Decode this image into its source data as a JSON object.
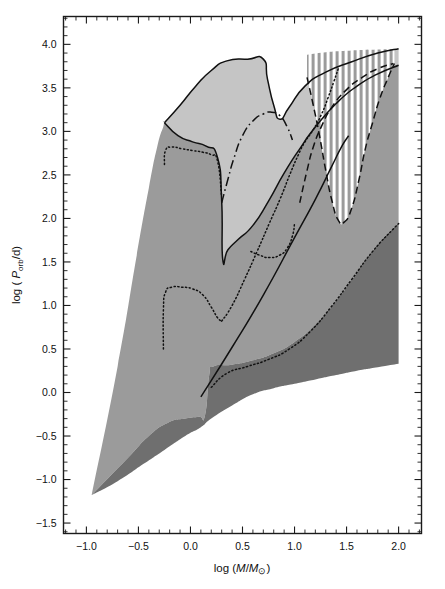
{
  "figure": {
    "background": "#ffffff",
    "frame_color": "#1a1a1a"
  },
  "axes": {
    "x_label": "log (M/M⊙)",
    "y_label": "log ( P",
    "y_label_sub": "orb",
    "y_label_tail": "/d)",
    "x_ticks": [
      "-1.0",
      "-0.5",
      "0.0",
      "0.5",
      "1.0",
      "1.5",
      "2.0"
    ],
    "y_ticks": [
      "4.0",
      "3.5",
      "3.0",
      "2.5",
      "2.0",
      "1.5",
      "1.0",
      "0.5",
      "0.0",
      "-0.5",
      "-1.0",
      "-1.5"
    ]
  },
  "colors": {
    "light_gray": "#c5c5c5",
    "mid_gray": "#9b9b9b",
    "dark_gray": "#6f6f6f",
    "hatch_white": "#ffffff",
    "line_black": "#111111"
  },
  "chart_data": {
    "type": "area",
    "title": "",
    "xlabel": "log (M/M⊙)",
    "ylabel": "log ( P_orb/d)",
    "xlim": [
      -1.22,
      2.22
    ],
    "ylim": [
      -1.62,
      4.32
    ],
    "grid": false,
    "legend": "none",
    "x_ticks": [
      -1.0,
      -0.5,
      0.0,
      0.5,
      1.0,
      1.5,
      2.0
    ],
    "y_ticks": [
      4.0,
      3.5,
      3.0,
      2.5,
      2.0,
      1.5,
      1.0,
      0.5,
      0.0,
      -0.5,
      -1.0,
      -1.5
    ],
    "x_minor_tick_step": 0.1,
    "y_minor_tick_step": 0.1,
    "regions": [
      {
        "name": "light-gray-region",
        "fill": "#c5c5c5",
        "description": "Upper light grey envelope spanning log M from about -0.25 to 2.0, top boundary rising from 3.1 to a plateau near 3.83 between 0.35 and 0.72, notching to 3.15 at 0.85, then rising again to 3.95 at 2.0",
        "upper_boundary": [
          [
            -0.25,
            3.1
          ],
          [
            -0.1,
            3.3
          ],
          [
            0.05,
            3.52
          ],
          [
            0.2,
            3.7
          ],
          [
            0.35,
            3.81
          ],
          [
            0.55,
            3.83
          ],
          [
            0.7,
            3.83
          ],
          [
            0.74,
            3.6
          ],
          [
            0.8,
            3.3
          ],
          [
            0.86,
            3.14
          ],
          [
            0.95,
            3.28
          ],
          [
            1.1,
            3.52
          ],
          [
            1.3,
            3.68
          ],
          [
            1.55,
            3.8
          ],
          [
            1.8,
            3.9
          ],
          [
            2.0,
            3.95
          ]
        ],
        "lower_boundary": [
          [
            -0.25,
            3.1
          ],
          [
            -0.12,
            2.95
          ],
          [
            0.02,
            2.88
          ],
          [
            0.15,
            2.83
          ],
          [
            0.26,
            2.7
          ],
          [
            0.3,
            2.2
          ],
          [
            0.31,
            1.53
          ],
          [
            0.36,
            1.64
          ],
          [
            0.46,
            1.76
          ],
          [
            0.6,
            1.92
          ],
          [
            0.75,
            2.2
          ],
          [
            0.9,
            2.52
          ],
          [
            1.05,
            2.8
          ],
          [
            1.2,
            3.05
          ],
          [
            1.4,
            3.32
          ],
          [
            1.6,
            3.52
          ],
          [
            1.8,
            3.66
          ],
          [
            2.0,
            3.76
          ]
        ]
      },
      {
        "name": "mid-gray-region",
        "fill": "#9b9b9b",
        "description": "Main medium grey wedge from the convergence point near (-0.95,-1.18) widening rightward; upper boundary peaks at 3.1 near -0.25 then drops to 1.53 at 0.30 and rises to 3.76 at 2.0",
        "upper_boundary": [
          [
            -0.95,
            -1.18
          ],
          [
            -0.7,
            0.3
          ],
          [
            -0.52,
            1.55
          ],
          [
            -0.4,
            2.35
          ],
          [
            -0.32,
            2.82
          ],
          [
            -0.26,
            3.06
          ],
          [
            -0.25,
            3.1
          ],
          [
            -0.12,
            2.95
          ],
          [
            0.02,
            2.88
          ],
          [
            0.15,
            2.83
          ],
          [
            0.26,
            2.7
          ],
          [
            0.3,
            2.2
          ],
          [
            0.31,
            1.53
          ],
          [
            0.36,
            1.64
          ],
          [
            0.46,
            1.76
          ],
          [
            0.6,
            1.92
          ],
          [
            0.75,
            2.2
          ],
          [
            0.9,
            2.52
          ],
          [
            1.05,
            2.8
          ],
          [
            1.2,
            3.05
          ],
          [
            1.4,
            3.32
          ],
          [
            1.6,
            3.52
          ],
          [
            1.8,
            3.66
          ],
          [
            2.0,
            3.76
          ]
        ],
        "lower_boundary": [
          [
            -0.95,
            -1.18
          ],
          [
            -0.6,
            -0.75
          ],
          [
            -0.4,
            -0.5
          ],
          [
            -0.22,
            -0.35
          ],
          [
            -0.05,
            -0.3
          ],
          [
            0.08,
            -0.28
          ],
          [
            0.14,
            -0.26
          ],
          [
            0.18,
            0.2
          ],
          [
            0.22,
            0.3
          ],
          [
            0.4,
            0.32
          ],
          [
            0.6,
            0.37
          ],
          [
            0.8,
            0.45
          ],
          [
            1.0,
            0.58
          ],
          [
            1.2,
            0.78
          ],
          [
            1.4,
            1.05
          ],
          [
            1.6,
            1.38
          ],
          [
            1.8,
            1.7
          ],
          [
            2.0,
            1.95
          ]
        ]
      },
      {
        "name": "dark-gray-band",
        "fill": "#6f6f6f",
        "description": "Narrow dark grey band along the lower edge of the medium grey wedge, widening to the right from the apex at (-0.95,-1.18) to span 0.33 to 1.95 at log M = 2.0",
        "upper_boundary": [
          [
            -0.95,
            -1.18
          ],
          [
            -0.6,
            -0.75
          ],
          [
            -0.4,
            -0.5
          ],
          [
            -0.22,
            -0.35
          ],
          [
            -0.05,
            -0.3
          ],
          [
            0.08,
            -0.28
          ],
          [
            0.14,
            -0.26
          ],
          [
            0.18,
            0.2
          ],
          [
            0.22,
            0.3
          ],
          [
            0.4,
            0.32
          ],
          [
            0.6,
            0.37
          ],
          [
            0.8,
            0.45
          ],
          [
            1.0,
            0.58
          ],
          [
            1.2,
            0.78
          ],
          [
            1.4,
            1.05
          ],
          [
            1.6,
            1.38
          ],
          [
            1.8,
            1.7
          ],
          [
            2.0,
            1.95
          ]
        ],
        "lower_boundary": [
          [
            -0.95,
            -1.18
          ],
          [
            -0.7,
            -1.02
          ],
          [
            -0.45,
            -0.82
          ],
          [
            -0.25,
            -0.66
          ],
          [
            -0.05,
            -0.5
          ],
          [
            0.1,
            -0.4
          ],
          [
            0.2,
            -0.3
          ],
          [
            0.4,
            -0.15
          ],
          [
            0.6,
            -0.02
          ],
          [
            0.8,
            0.05
          ],
          [
            1.0,
            0.1
          ],
          [
            1.2,
            0.15
          ],
          [
            1.4,
            0.2
          ],
          [
            1.6,
            0.25
          ],
          [
            1.8,
            0.29
          ],
          [
            2.0,
            0.33
          ]
        ]
      },
      {
        "name": "hatched-region",
        "fill": "vertical white stripes on grey",
        "description": "Vertically hatched lens-shaped region in the upper right, bounded left by the long-dash curve rising from about (1.05,2.18) and right by the dashed curve dipping to 1.95 near 1.43, topped by the light grey envelope upper edge near 3.7 to 3.95",
        "x_range": [
          1.12,
          1.95
        ],
        "y_range": [
          1.93,
          3.95
        ],
        "stripe_spacing_px": 6
      }
    ],
    "curves": [
      {
        "name": "solid-upper-envelope",
        "style": "solid",
        "points": [
          [
            -0.25,
            3.1
          ],
          [
            -0.1,
            3.3
          ],
          [
            0.05,
            3.52
          ],
          [
            0.2,
            3.7
          ],
          [
            0.35,
            3.81
          ],
          [
            0.55,
            3.83
          ],
          [
            0.7,
            3.83
          ],
          [
            0.74,
            3.6
          ],
          [
            0.8,
            3.3
          ],
          [
            0.86,
            3.14
          ],
          [
            0.95,
            3.28
          ],
          [
            1.1,
            3.52
          ],
          [
            1.3,
            3.68
          ],
          [
            1.55,
            3.8
          ],
          [
            1.8,
            3.9
          ],
          [
            2.0,
            3.95
          ]
        ]
      },
      {
        "name": "solid-inner-boundary",
        "style": "solid",
        "points": [
          [
            -0.25,
            3.1
          ],
          [
            -0.12,
            2.95
          ],
          [
            0.02,
            2.88
          ],
          [
            0.15,
            2.83
          ],
          [
            0.26,
            2.7
          ],
          [
            0.3,
            2.2
          ],
          [
            0.31,
            1.53
          ],
          [
            0.36,
            1.64
          ],
          [
            0.46,
            1.76
          ],
          [
            0.6,
            1.92
          ],
          [
            0.75,
            2.2
          ],
          [
            0.9,
            2.52
          ],
          [
            1.05,
            2.8
          ],
          [
            1.2,
            3.05
          ],
          [
            1.4,
            3.32
          ],
          [
            1.6,
            3.52
          ],
          [
            1.8,
            3.66
          ],
          [
            2.0,
            3.76
          ]
        ]
      },
      {
        "name": "dash-dot-curve",
        "style": "dash-dot",
        "points": [
          [
            0.3,
            2.18
          ],
          [
            0.36,
            2.45
          ],
          [
            0.42,
            2.7
          ],
          [
            0.5,
            2.95
          ],
          [
            0.6,
            3.12
          ],
          [
            0.7,
            3.2
          ],
          [
            0.78,
            3.22
          ],
          [
            0.86,
            3.18
          ],
          [
            0.93,
            3.05
          ],
          [
            0.98,
            2.9
          ]
        ]
      },
      {
        "name": "dotted-upper-left",
        "style": "dotted",
        "points": [
          [
            -0.25,
            2.62
          ],
          [
            -0.24,
            2.78
          ],
          [
            -0.18,
            2.82
          ],
          [
            -0.08,
            2.8
          ],
          [
            0.02,
            2.78
          ],
          [
            0.12,
            2.76
          ],
          [
            0.2,
            2.73
          ],
          [
            0.26,
            2.66
          ],
          [
            0.3,
            2.25
          ]
        ]
      },
      {
        "name": "dotted-lower-left",
        "style": "dotted",
        "points": [
          [
            -0.26,
            0.5
          ],
          [
            -0.26,
            0.95
          ],
          [
            -0.24,
            1.15
          ],
          [
            -0.18,
            1.21
          ],
          [
            -0.08,
            1.21
          ],
          [
            0.02,
            1.19
          ],
          [
            0.12,
            1.12
          ],
          [
            0.2,
            0.98
          ],
          [
            0.26,
            0.86
          ],
          [
            0.3,
            0.82
          ]
        ]
      },
      {
        "name": "dotted-mid-right",
        "style": "dotted",
        "points": [
          [
            0.3,
            0.82
          ],
          [
            0.4,
            1.0
          ],
          [
            0.52,
            1.3
          ],
          [
            0.64,
            1.62
          ],
          [
            0.76,
            1.95
          ],
          [
            0.86,
            2.22
          ],
          [
            0.96,
            2.52
          ],
          [
            1.04,
            2.74
          ],
          [
            1.1,
            2.88
          ],
          [
            1.18,
            3.02
          ],
          [
            1.26,
            3.2
          ],
          [
            1.32,
            3.38
          ],
          [
            1.38,
            3.58
          ],
          [
            1.42,
            3.72
          ]
        ]
      },
      {
        "name": "dotted-lower-hook",
        "style": "dotted",
        "points": [
          [
            0.58,
            1.62
          ],
          [
            0.66,
            1.58
          ],
          [
            0.76,
            1.55
          ],
          [
            0.86,
            1.58
          ],
          [
            0.93,
            1.66
          ],
          [
            0.98,
            1.8
          ],
          [
            1.0,
            1.94
          ]
        ]
      },
      {
        "name": "dotted-bottom-right",
        "style": "dotted",
        "points": [
          [
            0.2,
            0.06
          ],
          [
            0.35,
            0.22
          ],
          [
            0.55,
            0.3
          ],
          [
            0.75,
            0.38
          ],
          [
            0.95,
            0.5
          ],
          [
            1.15,
            0.7
          ],
          [
            1.35,
            0.98
          ],
          [
            1.55,
            1.3
          ],
          [
            1.75,
            1.62
          ],
          [
            1.95,
            1.88
          ],
          [
            2.0,
            1.94
          ]
        ]
      },
      {
        "name": "solid-diagonal-line",
        "style": "solid",
        "points": [
          [
            0.1,
            -0.05
          ],
          [
            0.4,
            0.52
          ],
          [
            0.7,
            1.12
          ],
          [
            1.0,
            1.78
          ],
          [
            1.2,
            2.22
          ],
          [
            1.35,
            2.58
          ],
          [
            1.45,
            2.82
          ],
          [
            1.52,
            2.95
          ]
        ]
      },
      {
        "name": "long-dash-curve",
        "style": "dashed",
        "points": [
          [
            1.05,
            2.18
          ],
          [
            1.12,
            2.55
          ],
          [
            1.18,
            2.82
          ],
          [
            1.26,
            3.06
          ],
          [
            1.36,
            3.28
          ],
          [
            1.5,
            3.48
          ],
          [
            1.65,
            3.62
          ],
          [
            1.8,
            3.72
          ],
          [
            1.95,
            3.78
          ]
        ]
      },
      {
        "name": "dashed-dip-curve",
        "style": "dashed",
        "points": [
          [
            1.12,
            3.62
          ],
          [
            1.18,
            3.3
          ],
          [
            1.24,
            2.95
          ],
          [
            1.3,
            2.55
          ],
          [
            1.36,
            2.2
          ],
          [
            1.42,
            1.98
          ],
          [
            1.48,
            1.96
          ],
          [
            1.55,
            2.12
          ],
          [
            1.62,
            2.45
          ],
          [
            1.68,
            2.8
          ],
          [
            1.75,
            3.1
          ],
          [
            1.82,
            3.38
          ],
          [
            1.9,
            3.62
          ],
          [
            1.96,
            3.78
          ]
        ]
      }
    ]
  }
}
